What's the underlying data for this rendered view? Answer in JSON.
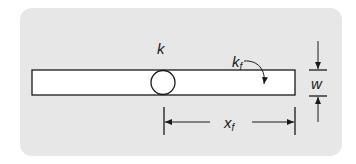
{
  "diagram": {
    "type": "geometry-sketch",
    "colors": {
      "background": "#ffffff",
      "panel": "#e7e7e7",
      "strip_fill": "#ffffff",
      "stroke": "#1a1a1a"
    },
    "labels": {
      "k": "k",
      "kf_main": "k",
      "kf_sub": "f",
      "w": "w",
      "xf_main": "x",
      "xf_sub": "f"
    },
    "shapes": {
      "panel": {
        "x": 20,
        "y": 8,
        "width": 322,
        "height": 148,
        "radius": 12
      },
      "strip": {
        "x": 32,
        "y": 70,
        "width": 263,
        "height": 25
      },
      "hole": {
        "cx": 163,
        "cy": 82.5,
        "r": 12
      }
    }
  }
}
